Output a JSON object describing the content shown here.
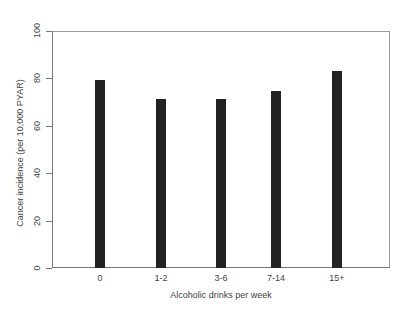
{
  "chart_data": {
    "type": "bar",
    "title": "",
    "xlabel": "Alcoholic drinks per week",
    "ylabel": "Cancer incidence (per 10,000 PYAR)",
    "categories": [
      "0",
      "1-2",
      "3-6",
      "7-14",
      "15+"
    ],
    "values": [
      79.5,
      71.5,
      71.5,
      74.5,
      83
    ],
    "ylim": [
      0,
      100
    ],
    "yticks": [
      "0",
      "20",
      "40",
      "60",
      "80",
      "100"
    ],
    "grid": false,
    "legend": null,
    "bar_color": "#222222"
  }
}
